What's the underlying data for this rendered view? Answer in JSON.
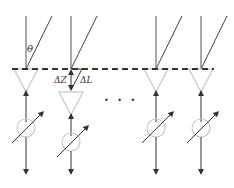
{
  "diagram": {
    "labels": {
      "theta": "θ",
      "delta_z": "ΔZ",
      "delta_l": "ΔL",
      "ellipsis": "• • •"
    },
    "elements": [
      {
        "id": 1,
        "x": 26,
        "offset": 0
      },
      {
        "id": 2,
        "x": 71,
        "offset": 23
      },
      {
        "id": 3,
        "x": 156,
        "offset": 0
      },
      {
        "id": 4,
        "x": 201,
        "offset": 0
      }
    ],
    "colors": {
      "line": "#333333",
      "ray": "#444444",
      "dashed_reference": "#333333",
      "antenna_triangle": "#cfcfcf",
      "phase_shifter_circle": "#c8c8c8"
    }
  }
}
